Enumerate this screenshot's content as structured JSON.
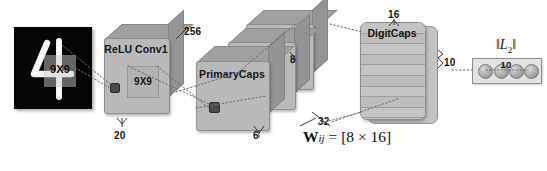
{
  "figure": {
    "type": "architecture-diagram",
    "background_color": "#ffffff"
  },
  "input": {
    "name": "mnist-input",
    "digit": "4",
    "patch_label": "9X9",
    "background_color": "#050505",
    "stroke_color": "#ffffff"
  },
  "layers": [
    {
      "id": "conv1",
      "label": "ReLU Conv1",
      "kernel_label": "9X9",
      "width_label": "20",
      "depth_label": "256"
    },
    {
      "id": "primarycaps",
      "label": "PrimaryCaps",
      "width_label": "6",
      "depth_label": "32",
      "capsule_dim_label": "8",
      "stack_count": 3
    },
    {
      "id": "digitcaps",
      "label": "DigitCaps",
      "top_label": "16",
      "side_label": "10",
      "rows": 10
    }
  ],
  "weights": {
    "symbol": "W",
    "subscript": "ij",
    "equals": "=",
    "shape": "[8 × 16]"
  },
  "output": {
    "label_prefix": "‖",
    "label_symbol": "L",
    "label_subscript": "2",
    "label_suffix": "‖",
    "count_label": "10",
    "node_count": 4
  },
  "colors": {
    "face": "#b9b9b9",
    "top": "#a0a0a0",
    "side": "#949494",
    "edge": "#8e8e8e",
    "pixel": "#4a4a4a",
    "text": "#141414",
    "connector": "#777777"
  }
}
